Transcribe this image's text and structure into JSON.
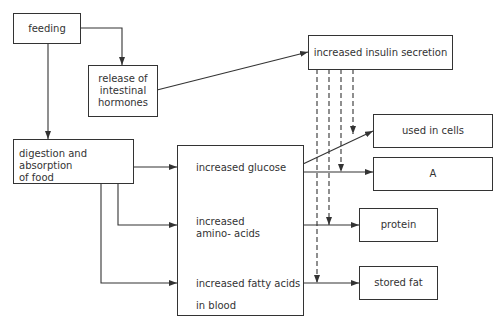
{
  "diagram": {
    "nodes": {
      "feeding": "feeding",
      "release_line1": "release of",
      "release_line2": "intestinal",
      "release_line3": "hormones",
      "insulin": "increased insulin secretion",
      "digestion_line1": "digestion and absorption",
      "digestion_line2": "of food",
      "blood_glucose": "increased glucose",
      "blood_amino_line1": "increased",
      "blood_amino_line2": "amino- acids",
      "blood_fatty_line1": "increased fatty acids",
      "blood_fatty_line2": "in blood",
      "used_in_cells": "used in cells",
      "a": "A",
      "protein": "protein",
      "stored_fat": "stored fat"
    },
    "edges": [
      {
        "from": "feeding",
        "to": "release of intestinal hormones",
        "style": "solid"
      },
      {
        "from": "feeding",
        "to": "digestion and absorption of food",
        "style": "solid"
      },
      {
        "from": "release of intestinal hormones",
        "to": "increased insulin secretion",
        "style": "solid"
      },
      {
        "from": "digestion and absorption of food",
        "to": "increased glucose",
        "style": "solid"
      },
      {
        "from": "digestion and absorption of food",
        "to": "increased amino- acids",
        "style": "solid"
      },
      {
        "from": "digestion and absorption of food",
        "to": "increased fatty acids in blood",
        "style": "solid"
      },
      {
        "from": "increased glucose",
        "to": "used in cells",
        "style": "solid"
      },
      {
        "from": "increased glucose",
        "to": "A",
        "style": "solid"
      },
      {
        "from": "increased amino- acids",
        "to": "protein",
        "style": "solid"
      },
      {
        "from": "increased fatty acids in blood",
        "to": "stored fat",
        "style": "solid"
      },
      {
        "from": "increased insulin secretion",
        "to": "used in cells",
        "style": "dashed"
      },
      {
        "from": "increased insulin secretion",
        "to": "A",
        "style": "dashed"
      },
      {
        "from": "increased insulin secretion",
        "to": "protein",
        "style": "dashed"
      },
      {
        "from": "increased insulin secretion",
        "to": "stored fat",
        "style": "dashed"
      }
    ],
    "colors": {
      "line": "#333333",
      "background": "#ffffff"
    }
  }
}
